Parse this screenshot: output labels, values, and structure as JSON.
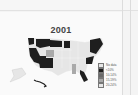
{
  "map": {
    "title": "2001",
    "region": "United States",
    "colors": {
      "darkest": "#1e1e1e",
      "dark": "#6a6a6a",
      "medium": "#a9a9a9",
      "light": "#e6e6e6",
      "border": "#ffffff"
    },
    "legend": {
      "heading": "No data",
      "items": [
        {
          "label": "No data",
          "color": "#e6e6e6"
        },
        {
          "label": "<10%",
          "color": "#1e1e1e"
        },
        {
          "label": "10-14%",
          "color": "#6a6a6a"
        },
        {
          "label": "15-19%",
          "color": "#a9a9a9"
        },
        {
          "label": "20-24%",
          "color": "#e6e6e6"
        }
      ]
    }
  }
}
